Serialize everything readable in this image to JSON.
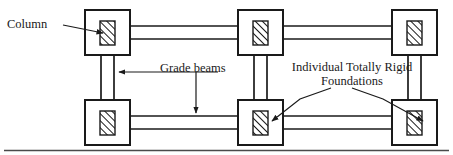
{
  "figure": {
    "type": "engineering-diagram",
    "background_color": "#ffffff",
    "line_color": "#1a1a1a"
  },
  "labels": {
    "column": "Column",
    "grade_beams": "Grade beams",
    "foundations_line1": "Individual Totally Rigid",
    "foundations_line2": "Foundations"
  },
  "structure": {
    "foundation_count": 6,
    "rows": 2,
    "columns_per_row": 3,
    "foundations": [
      {
        "id": "foundation-top-left",
        "row": "top",
        "col": "left",
        "x": 85,
        "y": 10,
        "w": 45,
        "h": 45
      },
      {
        "id": "foundation-top-center",
        "row": "top",
        "col": "center",
        "x": 238,
        "y": 10,
        "w": 45,
        "h": 45
      },
      {
        "id": "foundation-top-right",
        "row": "top",
        "col": "right",
        "x": 392,
        "y": 10,
        "w": 45,
        "h": 45
      },
      {
        "id": "foundation-bottom-left",
        "row": "bottom",
        "col": "left",
        "x": 85,
        "y": 100,
        "w": 45,
        "h": 45
      },
      {
        "id": "foundation-bottom-center",
        "row": "bottom",
        "col": "center",
        "x": 238,
        "y": 100,
        "w": 45,
        "h": 45
      },
      {
        "id": "foundation-bottom-right",
        "row": "bottom",
        "col": "right",
        "x": 392,
        "y": 100,
        "w": 45,
        "h": 45
      }
    ],
    "column_stub": {
      "w": 15,
      "h": 24,
      "hatch": "diagonal-45-up",
      "note": "hatched rectangle centered in each foundation"
    },
    "grade_beams": {
      "rendering": "pairs of parallel lines",
      "horizontal_offsets": [
        -6.5,
        6.5
      ],
      "vertical_offsets": [
        -6.5,
        6.5
      ],
      "horizontal_runs": [
        {
          "from": "foundation-top-left",
          "to": "foundation-top-center"
        },
        {
          "from": "foundation-top-center",
          "to": "foundation-top-right"
        },
        {
          "from": "foundation-bottom-left",
          "to": "foundation-bottom-center"
        },
        {
          "from": "foundation-bottom-center",
          "to": "foundation-bottom-right"
        }
      ],
      "vertical_runs": [
        {
          "from": "foundation-top-left",
          "to": "foundation-bottom-left"
        },
        {
          "from": "foundation-top-center",
          "to": "foundation-bottom-center"
        },
        {
          "from": "foundation-top-right",
          "to": "foundation-bottom-right"
        }
      ]
    },
    "ground_line": {
      "y": 150,
      "x1": 4,
      "x2": 449
    }
  },
  "leaders": {
    "column": {
      "from": [
        63,
        26
      ],
      "to": [
        104,
        33
      ],
      "arrow": true
    },
    "grade_beams_left": {
      "path": "M 220 72 L 128 72 L 112 72",
      "arrow": true
    },
    "grade_beams_down": {
      "path": "M 196 72 L 196 112",
      "arrow": true
    },
    "foundations_left": {
      "path": "M 331 88 L 302 99 L 272 121",
      "arrow": true
    },
    "foundations_right": {
      "path": "M 352 88 L 381 99 L 424 121",
      "arrow": true
    }
  }
}
